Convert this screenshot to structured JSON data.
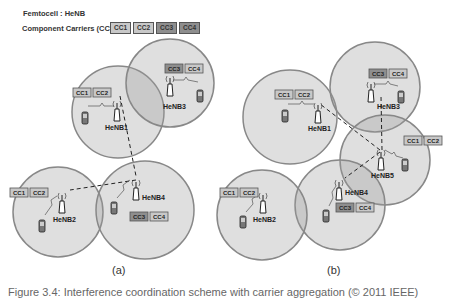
{
  "legend": {
    "femtocell_line": "Femtocell : HeNB",
    "cc_label": "Component Carriers (CC):",
    "carriers": [
      "CC1",
      "CC2",
      "CC3",
      "CC4"
    ]
  },
  "panel_a": {
    "label": "(a)",
    "nodes": [
      {
        "name": "HeNB1",
        "carriers": [
          "CC1",
          "CC2"
        ]
      },
      {
        "name": "HeNB3",
        "carriers": [
          "CC3",
          "CC4"
        ]
      },
      {
        "name": "HeNB2",
        "carriers": [
          "CC1",
          "CC2"
        ]
      },
      {
        "name": "HeNB4",
        "carriers": [
          "CC3",
          "CC4"
        ]
      }
    ]
  },
  "panel_b": {
    "label": "(b)",
    "nodes": [
      {
        "name": "HeNB1",
        "carriers": [
          "CC1",
          "CC2"
        ]
      },
      {
        "name": "HeNB3",
        "carriers": [
          "CC3",
          "CC4"
        ]
      },
      {
        "name": "HeNB5",
        "carriers": [
          "CC1",
          "CC2"
        ]
      },
      {
        "name": "HeNB2",
        "carriers": [
          "CC1",
          "CC2"
        ]
      },
      {
        "name": "HeNB4",
        "carriers": [
          "CC3",
          "CC4"
        ]
      }
    ]
  },
  "caption": "Figure 3.4: Interference coordination scheme with carrier aggregation (© 2011 IEEE)"
}
